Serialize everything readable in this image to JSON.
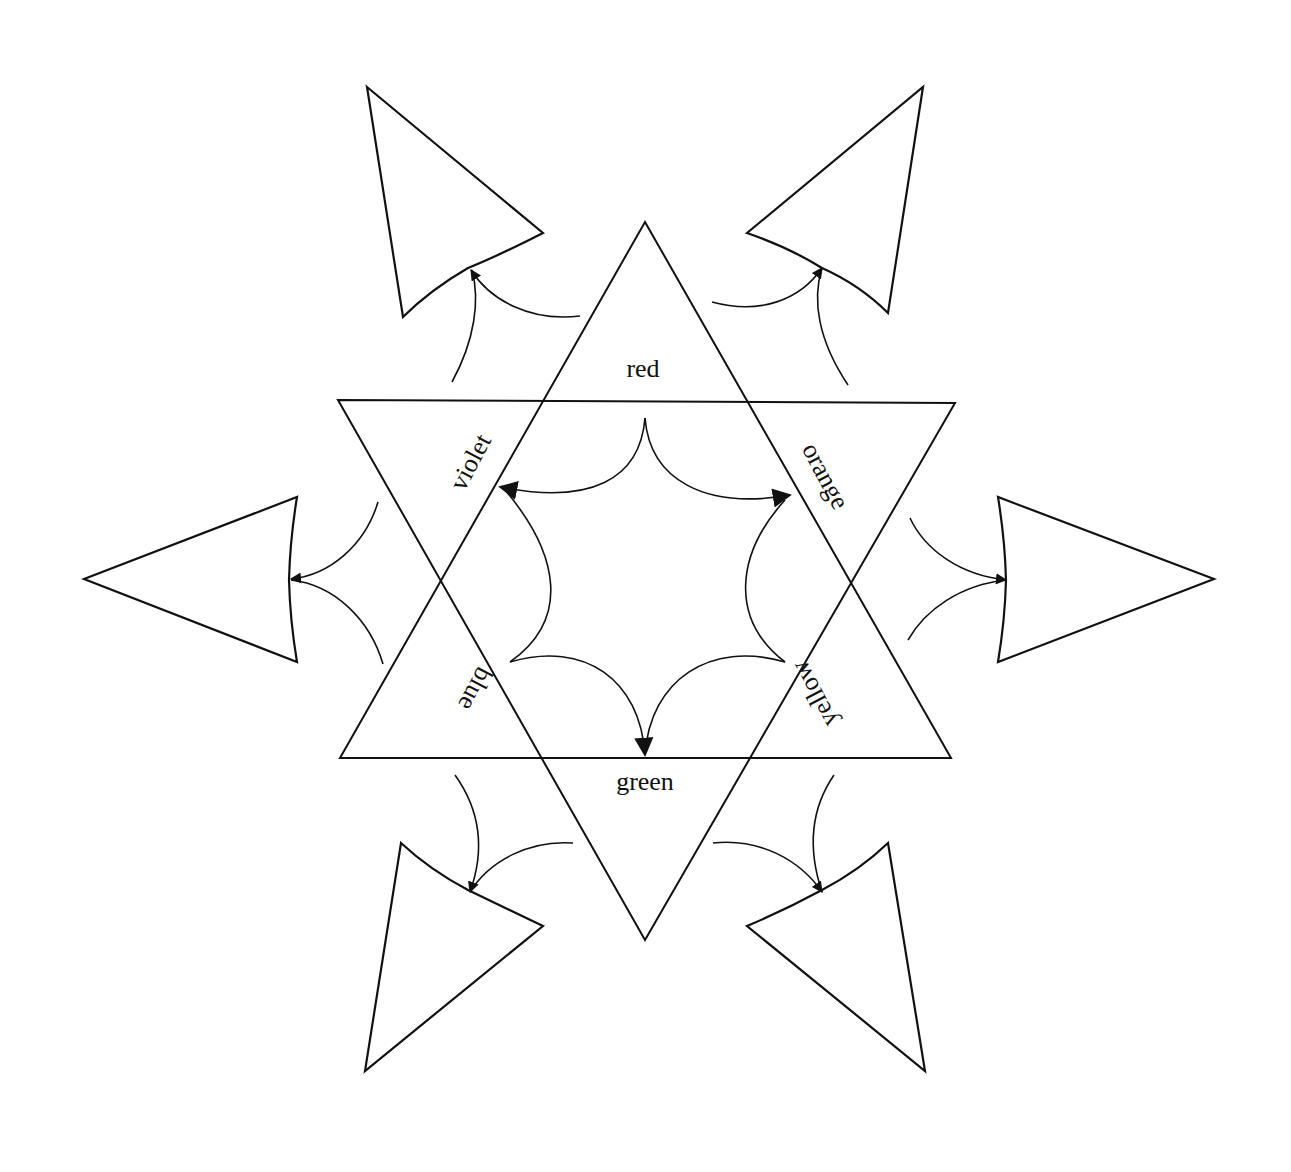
{
  "diagram": {
    "type": "color-wheel-star",
    "labels": {
      "red": "red",
      "orange": "orange",
      "yellow": "yellow",
      "green": "green",
      "blue": "blue",
      "violet": "violet"
    },
    "stroke_color": "#111111",
    "background_color": "#ffffff"
  }
}
